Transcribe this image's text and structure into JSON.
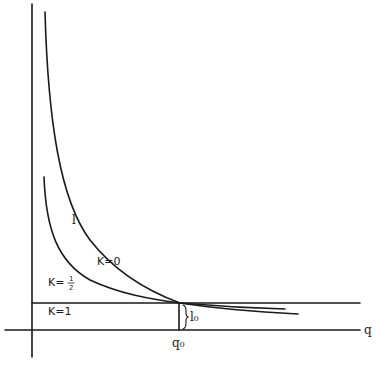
{
  "diagram": {
    "type": "economic-curves",
    "axes": {
      "x_label": "q",
      "y_label": ""
    },
    "marker": {
      "x_label": "q₀",
      "gap_label": "l₀"
    },
    "curves": [
      {
        "id": "k0",
        "label": "K=0",
        "curve_label": "l"
      },
      {
        "id": "k_half",
        "label": "K=",
        "fraction_num": "1",
        "fraction_den": "2"
      },
      {
        "id": "k1",
        "label": "K=1"
      }
    ],
    "colors": {
      "ink": "#1a1a1a",
      "background": "#ffffff"
    }
  }
}
